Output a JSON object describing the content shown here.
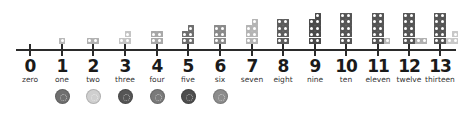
{
  "diagram": {
    "axis": {
      "start": 0,
      "end": 13
    },
    "numbers": [
      {
        "value": "0",
        "word": "zero",
        "x": 30,
        "blocks": 0,
        "color": "#9a9a9a",
        "extra_color": "#c8c8c8"
      },
      {
        "value": "1",
        "word": "one",
        "x": 62,
        "blocks": 1,
        "color": "#b8b8b8",
        "extra_color": "#b8b8b8"
      },
      {
        "value": "2",
        "word": "two",
        "x": 93,
        "blocks": 2,
        "color": "#b0b0b0",
        "extra_color": "#b0b0b0"
      },
      {
        "value": "3",
        "word": "three",
        "x": 125,
        "blocks": 3,
        "color": "#c4c4c4",
        "extra_color": "#c4c4c4"
      },
      {
        "value": "4",
        "word": "four",
        "x": 157,
        "blocks": 4,
        "color": "#a8a8a8",
        "extra_color": "#a8a8a8"
      },
      {
        "value": "5",
        "word": "five",
        "x": 188,
        "blocks": 5,
        "color": "#6e6e6e",
        "extra_color": "#6e6e6e"
      },
      {
        "value": "6",
        "word": "six",
        "x": 220,
        "blocks": 6,
        "color": "#8a8a8a",
        "extra_color": "#8a8a8a"
      },
      {
        "value": "7",
        "word": "seven",
        "x": 252,
        "blocks": 7,
        "color": "#b4b4b4",
        "extra_color": "#b4b4b4"
      },
      {
        "value": "8",
        "word": "eight",
        "x": 283,
        "blocks": 8,
        "color": "#5c5c5c",
        "extra_color": "#5c5c5c"
      },
      {
        "value": "9",
        "word": "nine",
        "x": 315,
        "blocks": 9,
        "color": "#4a4a4a",
        "extra_color": "#4a4a4a"
      },
      {
        "value": "10",
        "word": "ten",
        "x": 346,
        "blocks": 10,
        "color": "#555555",
        "extra_color": "#555555"
      },
      {
        "value": "11",
        "word": "eleven",
        "x": 378,
        "blocks": 11,
        "color": "#555555",
        "extra_color": "#b8b8b8"
      },
      {
        "value": "12",
        "word": "twelve",
        "x": 409,
        "blocks": 12,
        "color": "#555555",
        "extra_color": "#b0b0b0"
      },
      {
        "value": "13",
        "word": "thirteen",
        "x": 440,
        "blocks": 13,
        "color": "#555555",
        "extra_color": "#c8c8c8"
      }
    ],
    "counters": [
      {
        "under": "1",
        "x": 62,
        "color": "#6f6f6f"
      },
      {
        "under": "2",
        "x": 93,
        "color": "#cfcfcf"
      },
      {
        "under": "3",
        "x": 125,
        "color": "#555555"
      },
      {
        "under": "4",
        "x": 157,
        "color": "#7a7a7a"
      },
      {
        "under": "5",
        "x": 188,
        "color": "#4e4e4e"
      },
      {
        "under": "6",
        "x": 220,
        "color": "#8c8c8c"
      }
    ]
  }
}
